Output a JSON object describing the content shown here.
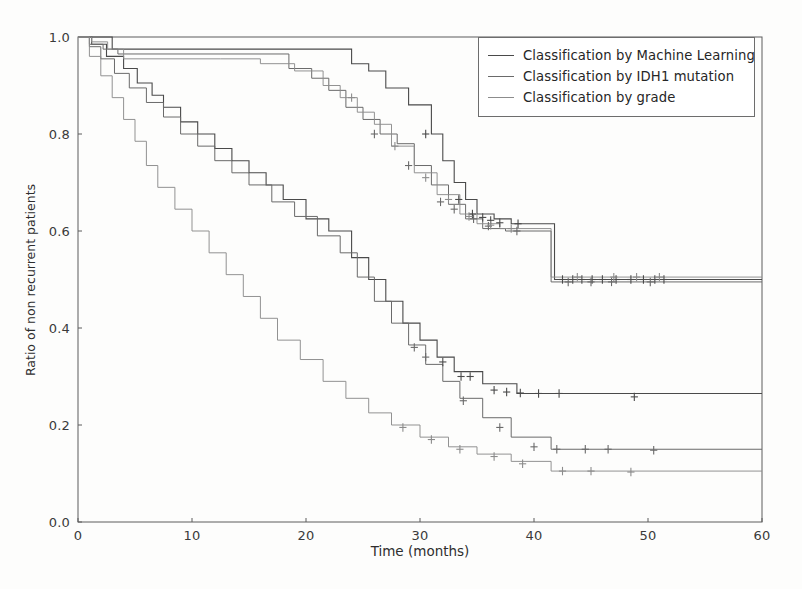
{
  "chart_data": {
    "type": "line",
    "title": "",
    "subtitle": "",
    "xlabel": "Time (months)",
    "ylabel": "Ratio of non recurrent patients",
    "xlim": [
      0,
      60
    ],
    "ylim": [
      0.0,
      1.0
    ],
    "xticks": [
      0,
      10,
      20,
      30,
      40,
      50,
      60
    ],
    "xticklabels": [
      "0",
      "10",
      "20",
      "30",
      "40",
      "50",
      "60"
    ],
    "yticks": [
      0.0,
      0.2,
      0.4,
      0.6,
      0.8,
      1.0
    ],
    "yticklabels": [
      "0.0",
      "0.2",
      "0.4",
      "0.6",
      "0.8",
      "1.0"
    ],
    "grid": false,
    "legend_position": "upper right",
    "step_style": "post",
    "censoring_marker": "+",
    "legend": [
      "Classification by Machine Learning",
      "Classification by IDH1 mutation",
      "Classification by grade"
    ],
    "series": [
      {
        "name": "Machine Learning - favorable group",
        "group": "Classification by Machine Learning",
        "color": "#4a4a4a",
        "linewidth": 1.1,
        "x": [
          0,
          1.5,
          3.0,
          21.5,
          24.0,
          25.5,
          27.0,
          29.0,
          31.0,
          32.0,
          33.0,
          34.0,
          35.0,
          36.5,
          38.0,
          41.0,
          41.8,
          60
        ],
        "y": [
          1.0,
          1.0,
          0.975,
          0.975,
          0.945,
          0.93,
          0.895,
          0.86,
          0.8,
          0.745,
          0.7,
          0.665,
          0.635,
          0.625,
          0.615,
          0.615,
          0.5,
          0.5
        ],
        "censored_x": [
          30.5,
          33.4,
          34.6,
          35.5,
          36.2,
          37.0,
          38.6,
          42.5,
          43.4,
          44.2,
          45.1,
          46.0,
          47.2,
          48.5,
          49.6,
          50.6,
          51.4
        ],
        "censored_y": [
          0.8,
          0.665,
          0.635,
          0.628,
          0.622,
          0.617,
          0.615,
          0.5,
          0.5,
          0.5,
          0.5,
          0.5,
          0.5,
          0.5,
          0.5,
          0.5,
          0.5
        ]
      },
      {
        "name": "Machine Learning - unfavorable group",
        "group": "Classification by Machine Learning",
        "color": "#4a4a4a",
        "linewidth": 1.1,
        "x": [
          0,
          1.2,
          2.5,
          4.0,
          5.2,
          6.5,
          7.5,
          9.0,
          10.5,
          12.0,
          13.5,
          15.0,
          16.5,
          18.0,
          20.0,
          22.0,
          24.0,
          25.5,
          27.0,
          28.5,
          30.0,
          31.5,
          33.0,
          35.5,
          38.5,
          41.5,
          60
        ],
        "y": [
          1.0,
          0.985,
          0.96,
          0.935,
          0.905,
          0.88,
          0.855,
          0.825,
          0.8,
          0.77,
          0.745,
          0.72,
          0.695,
          0.665,
          0.625,
          0.6,
          0.545,
          0.5,
          0.455,
          0.41,
          0.375,
          0.34,
          0.31,
          0.285,
          0.265,
          0.265,
          0.265
        ],
        "censored_x": [
          32.0,
          33.6,
          34.4,
          36.5,
          37.6,
          38.8,
          40.4,
          42.2,
          48.8
        ],
        "censored_y": [
          0.33,
          0.3,
          0.3,
          0.272,
          0.268,
          0.266,
          0.265,
          0.265,
          0.258
        ]
      },
      {
        "name": "IDH1 mutation - mutated group",
        "group": "Classification by IDH1 mutation",
        "color": "#6a6a6a",
        "linewidth": 1.0,
        "x": [
          0,
          1.0,
          2.2,
          3.5,
          15.0,
          18.5,
          20.5,
          22.0,
          23.5,
          25.0,
          26.5,
          28.0,
          29.5,
          31.0,
          32.5,
          34.0,
          35.5,
          37.5,
          41.5,
          60
        ],
        "y": [
          1.0,
          0.985,
          0.975,
          0.965,
          0.965,
          0.935,
          0.915,
          0.89,
          0.855,
          0.83,
          0.8,
          0.78,
          0.735,
          0.695,
          0.655,
          0.625,
          0.605,
          0.6,
          0.495,
          0.495
        ],
        "censored_x": [
          26.0,
          29.0,
          31.8,
          33.0,
          34.7,
          36.0,
          38.5,
          43.0,
          45.0,
          46.8,
          50.2
        ],
        "censored_y": [
          0.8,
          0.735,
          0.66,
          0.645,
          0.625,
          0.61,
          0.6,
          0.495,
          0.495,
          0.495,
          0.495
        ]
      },
      {
        "name": "IDH1 mutation - wildtype group",
        "group": "Classification by IDH1 mutation",
        "color": "#6a6a6a",
        "linewidth": 1.0,
        "x": [
          0,
          1.0,
          2.0,
          3.2,
          4.5,
          6.0,
          7.5,
          9.0,
          10.5,
          12.0,
          13.5,
          15.0,
          17.0,
          19.0,
          21.0,
          23.0,
          24.5,
          26.0,
          27.5,
          29.0,
          30.5,
          32.0,
          33.5,
          35.5,
          38.0,
          41.5,
          60
        ],
        "y": [
          1.0,
          0.98,
          0.955,
          0.925,
          0.895,
          0.865,
          0.835,
          0.8,
          0.775,
          0.745,
          0.72,
          0.695,
          0.66,
          0.63,
          0.59,
          0.555,
          0.505,
          0.455,
          0.41,
          0.365,
          0.325,
          0.29,
          0.255,
          0.215,
          0.175,
          0.15,
          0.15
        ],
        "censored_x": [
          29.5,
          30.5,
          33.8,
          37.0,
          40.0,
          42.0,
          44.5,
          46.5,
          50.5
        ],
        "censored_y": [
          0.36,
          0.34,
          0.25,
          0.195,
          0.155,
          0.15,
          0.15,
          0.15,
          0.148
        ]
      },
      {
        "name": "Grade - low grade group",
        "group": "Classification by grade",
        "color": "#8c8c8c",
        "linewidth": 0.95,
        "x": [
          0,
          1.2,
          2.6,
          4.0,
          12.5,
          16.0,
          19.0,
          21.5,
          23.0,
          24.5,
          26.0,
          27.5,
          29.5,
          31.5,
          33.5,
          35.0,
          37.0,
          41.5,
          60
        ],
        "y": [
          1.0,
          0.99,
          0.975,
          0.955,
          0.955,
          0.945,
          0.93,
          0.9,
          0.875,
          0.845,
          0.82,
          0.775,
          0.72,
          0.675,
          0.635,
          0.615,
          0.605,
          0.505,
          0.505
        ],
        "censored_x": [
          24.0,
          27.8,
          30.5,
          32.5,
          34.3,
          36.2,
          38.0,
          43.8,
          47.0,
          49.0,
          51.0
        ],
        "censored_y": [
          0.875,
          0.775,
          0.71,
          0.665,
          0.63,
          0.612,
          0.605,
          0.505,
          0.505,
          0.505,
          0.505
        ]
      },
      {
        "name": "Grade - high grade group",
        "group": "Classification by grade",
        "color": "#8c8c8c",
        "linewidth": 0.95,
        "x": [
          0,
          1.0,
          2.0,
          3.0,
          4.0,
          5.0,
          6.0,
          7.0,
          8.5,
          10.0,
          11.5,
          13.0,
          14.5,
          16.0,
          17.5,
          19.5,
          21.5,
          23.5,
          25.5,
          27.5,
          30.0,
          32.5,
          35.0,
          38.0,
          41.5,
          60
        ],
        "y": [
          1.0,
          0.96,
          0.92,
          0.875,
          0.83,
          0.785,
          0.735,
          0.69,
          0.645,
          0.6,
          0.555,
          0.51,
          0.465,
          0.42,
          0.375,
          0.335,
          0.29,
          0.255,
          0.225,
          0.2,
          0.175,
          0.155,
          0.14,
          0.125,
          0.105,
          0.105
        ],
        "censored_x": [
          28.5,
          31.0,
          33.5,
          36.5,
          39.0,
          42.5,
          45.0,
          48.5
        ],
        "censored_y": [
          0.195,
          0.17,
          0.15,
          0.135,
          0.12,
          0.105,
          0.105,
          0.103
        ]
      }
    ]
  },
  "axes": {
    "xlabel": "Time (months)",
    "ylabel": "Ratio of non recurrent patients"
  },
  "legend": {
    "items": [
      {
        "label": "Classification by Machine Learning",
        "color": "#4a4a4a"
      },
      {
        "label": "Classification by IDH1 mutation",
        "color": "#6a6a6a"
      },
      {
        "label": "Classification by grade",
        "color": "#8c8c8c"
      }
    ]
  }
}
